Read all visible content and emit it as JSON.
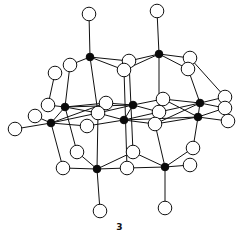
{
  "figure": {
    "label": "3",
    "colors": {
      "metal_atom": "#0a0a0a",
      "ligand_atom": "#ffffff",
      "bond": "#111111"
    },
    "atom_types": [
      "metal (filled black)",
      "ligand (open circle)"
    ],
    "metal_atom_count": 10,
    "ligand_atom_count": 29
  }
}
